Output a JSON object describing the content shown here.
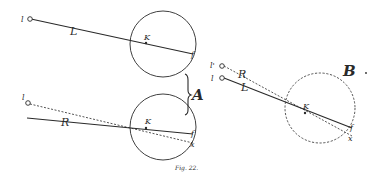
{
  "figure": {
    "caption": "Fig. 22.",
    "colors": {
      "ink": "#2a2a2a",
      "background": "#ffffff"
    },
    "group_A": {
      "label": "A",
      "upper": {
        "point_label": "l",
        "line_label": "L",
        "nodal_label": "K",
        "focus_label": "f"
      },
      "lower": {
        "point_label": "l",
        "line_label": "R",
        "nodal_label": "K",
        "focus_label": "f",
        "image_label": "x"
      }
    },
    "group_B": {
      "label": "B",
      "point_prime_label": "l'",
      "point_label": "l",
      "dashed_line_label": "R",
      "solid_line_label": "L",
      "nodal_label": "K",
      "focus_label": "f",
      "image_label": "x"
    }
  }
}
